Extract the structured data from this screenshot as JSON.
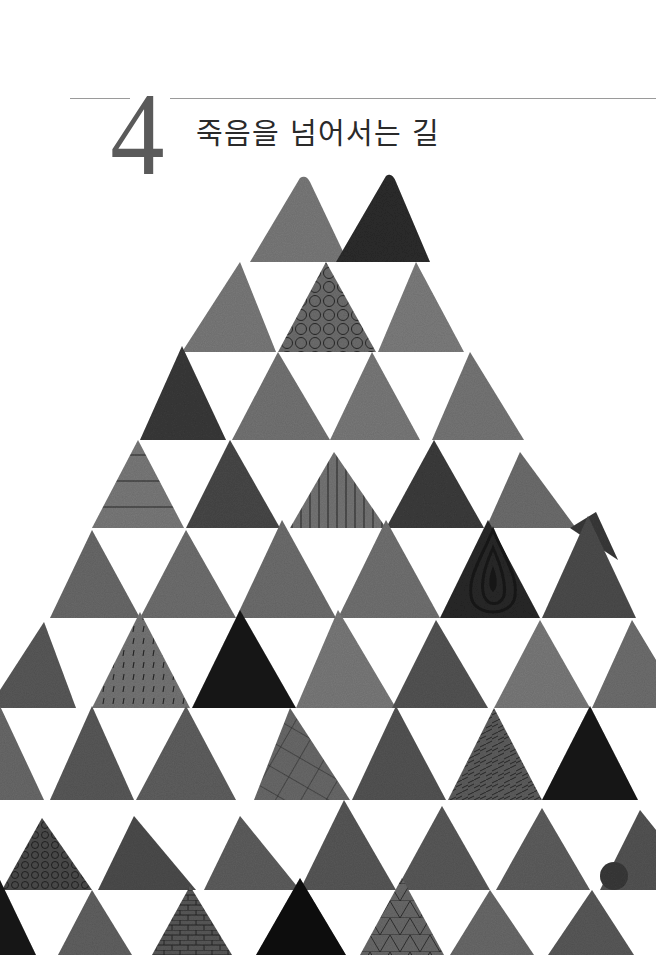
{
  "chapter": {
    "number": "4",
    "title": "죽음을 넘어서는 길"
  },
  "illustration": {
    "description": "watercolor triangle pyramid pattern",
    "palette": {
      "light": "#8a8a8a",
      "mid": "#6e6e6e",
      "dark": "#4a4a4a",
      "darkest": "#2a2a2a",
      "line": "#222222",
      "paper": "#ffffff"
    }
  }
}
